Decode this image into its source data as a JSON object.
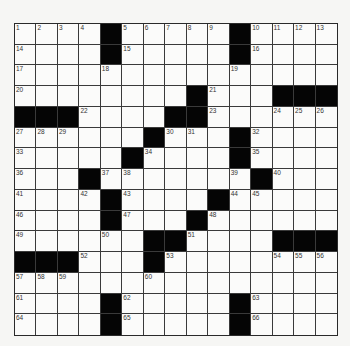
{
  "puzzle": {
    "rows": 15,
    "cols": 15,
    "grid": [
      [
        "1",
        "2",
        "3",
        "4",
        "#",
        "5",
        "6",
        "7",
        "8",
        "9",
        "#",
        "10",
        "11",
        "12",
        "13"
      ],
      [
        "14",
        ".",
        ".",
        ".",
        "#",
        "15",
        ".",
        ".",
        ".",
        ".",
        "#",
        "16",
        ".",
        ".",
        "."
      ],
      [
        "17",
        ".",
        ".",
        ".",
        "18",
        ".",
        ".",
        ".",
        ".",
        ".",
        "19",
        ".",
        ".",
        ".",
        "."
      ],
      [
        "20",
        ".",
        ".",
        ".",
        ".",
        ".",
        ".",
        ".",
        "#",
        "21",
        ".",
        ".",
        "#",
        "#",
        "#"
      ],
      [
        "#",
        "#",
        "#",
        "22",
        ".",
        ".",
        ".",
        "#",
        "#",
        "23",
        ".",
        ".",
        "24",
        "25",
        "26"
      ],
      [
        "27",
        "28",
        "29",
        ".",
        ".",
        ".",
        "#",
        "30",
        "31",
        ".",
        "#",
        "32",
        ".",
        ".",
        "."
      ],
      [
        "33",
        ".",
        ".",
        ".",
        ".",
        "#",
        "34",
        ".",
        ".",
        ".",
        "#",
        "35",
        ".",
        ".",
        "."
      ],
      [
        "36",
        ".",
        ".",
        "#",
        "37",
        "38",
        ".",
        ".",
        ".",
        ".",
        "39",
        "#",
        "40",
        ".",
        "."
      ],
      [
        "41",
        ".",
        ".",
        "42",
        "#",
        "43",
        ".",
        ".",
        ".",
        "#",
        "44",
        "45",
        ".",
        ".",
        "."
      ],
      [
        "46",
        ".",
        ".",
        ".",
        "#",
        "47",
        ".",
        ".",
        "#",
        "48",
        ".",
        ".",
        ".",
        ".",
        "."
      ],
      [
        "49",
        ".",
        ".",
        ".",
        "50",
        ".",
        "#",
        "#",
        "51",
        ".",
        ".",
        ".",
        "#",
        "#",
        "#"
      ],
      [
        "#",
        "#",
        "#",
        "52",
        ".",
        ".",
        "#",
        "53",
        ".",
        ".",
        ".",
        ".",
        "54",
        "55",
        "56"
      ],
      [
        "57",
        "58",
        "59",
        ".",
        ".",
        ".",
        "60",
        ".",
        ".",
        ".",
        ".",
        ".",
        ".",
        ".",
        "."
      ],
      [
        "61",
        ".",
        ".",
        ".",
        "#",
        "62",
        ".",
        ".",
        ".",
        ".",
        "#",
        "63",
        ".",
        ".",
        "."
      ],
      [
        "64",
        ".",
        ".",
        ".",
        "#",
        "65",
        ".",
        ".",
        ".",
        ".",
        "#",
        "66",
        ".",
        ".",
        "."
      ]
    ],
    "colors": {
      "block": "#050505",
      "cell": "#fbfbfa",
      "line": "#3a3a3a",
      "background": "#f6f6f4"
    }
  }
}
